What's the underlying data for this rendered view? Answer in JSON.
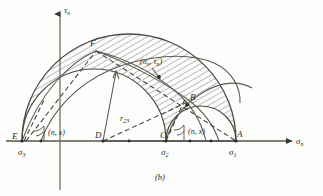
{
  "figure": {
    "caption": "(b)",
    "type": "mohr-circle-3d",
    "axes": {
      "x_label": "σ",
      "x_label_sub": "n",
      "y_label": "τ",
      "y_label_sub": "n",
      "x_axis_y": 141,
      "y_axis_x": 60
    },
    "points": [
      {
        "name": "E",
        "label": "E",
        "x": 22,
        "y": 141,
        "axis_label": "σ",
        "axis_sub": "3"
      },
      {
        "name": "C",
        "label": "C",
        "x": 166,
        "y": 141,
        "axis_label": "σ",
        "axis_sub": "2"
      },
      {
        "name": "A",
        "label": "A",
        "x": 236,
        "y": 141,
        "axis_label": "σ",
        "axis_sub": "1"
      },
      {
        "name": "D",
        "label": "D",
        "x": 103,
        "y": 141,
        "axis_label": "",
        "axis_sub": ""
      },
      {
        "name": "F",
        "label": "F",
        "x": 96,
        "y": 51,
        "axis_label": "",
        "axis_sub": ""
      },
      {
        "name": "B",
        "label": "B",
        "x": 190,
        "y": 101,
        "axis_label": "",
        "axis_sub": ""
      }
    ],
    "annotations": [
      {
        "name": "stress-point",
        "text": "(σ",
        "sub1": "n",
        "mid": ", τ",
        "sub2": "n",
        "end": ")",
        "x": 143,
        "y": 62
      },
      {
        "name": "radius-r23",
        "text": "r",
        "sub": "23",
        "x": 124,
        "y": 120
      },
      {
        "name": "angle-left",
        "text": "(n, x)",
        "x": 59,
        "y": 134
      },
      {
        "name": "angle-right",
        "text": "(n, x)",
        "x": 183,
        "y": 133
      }
    ],
    "circles": {
      "big_13": {
        "cx": 129,
        "cy": 141,
        "r": 107
      },
      "mid_12": {
        "cx": 201,
        "cy": 141,
        "r": 35
      },
      "mid_23": {
        "cx": 94,
        "cy": 141,
        "r": 72
      }
    },
    "tick_dots": [
      {
        "x": 41,
        "y": 141
      },
      {
        "x": 129,
        "y": 141
      },
      {
        "x": 190,
        "y": 141
      },
      {
        "x": 211,
        "y": 141
      }
    ],
    "hatch_region": "annular band between inner circles and outer circle"
  }
}
